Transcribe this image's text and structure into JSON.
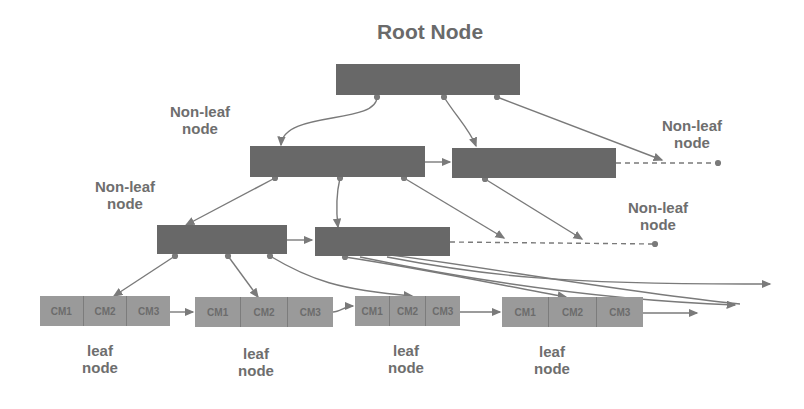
{
  "title": "Root Node",
  "labels": {
    "non_leaf_1": [
      "Non-leaf",
      "node"
    ],
    "non_leaf_2": [
      "Non-leaf",
      "node"
    ],
    "non_leaf_3": [
      "Non-leaf",
      "node"
    ],
    "non_leaf_4": [
      "Non-leaf",
      "node"
    ],
    "leaf_1": [
      "leaf",
      "node"
    ],
    "leaf_2": [
      "leaf",
      "node"
    ],
    "leaf_3": [
      "leaf",
      "node"
    ],
    "leaf_4": [
      "leaf",
      "node"
    ]
  },
  "leaf_nodes": [
    {
      "cells": [
        "CM1",
        "CM2",
        "CM3"
      ]
    },
    {
      "cells": [
        "CM1",
        "CM2",
        "CM3"
      ]
    },
    {
      "cells": [
        "CM1",
        "CM2",
        "CM3"
      ]
    },
    {
      "cells": [
        "CM1",
        "CM2",
        "CM3"
      ]
    }
  ],
  "colors": {
    "internal_node": "#686868",
    "leaf_node": "#9a9a9a",
    "edge": "#7a7a7a",
    "label": "#6e6e6e"
  }
}
